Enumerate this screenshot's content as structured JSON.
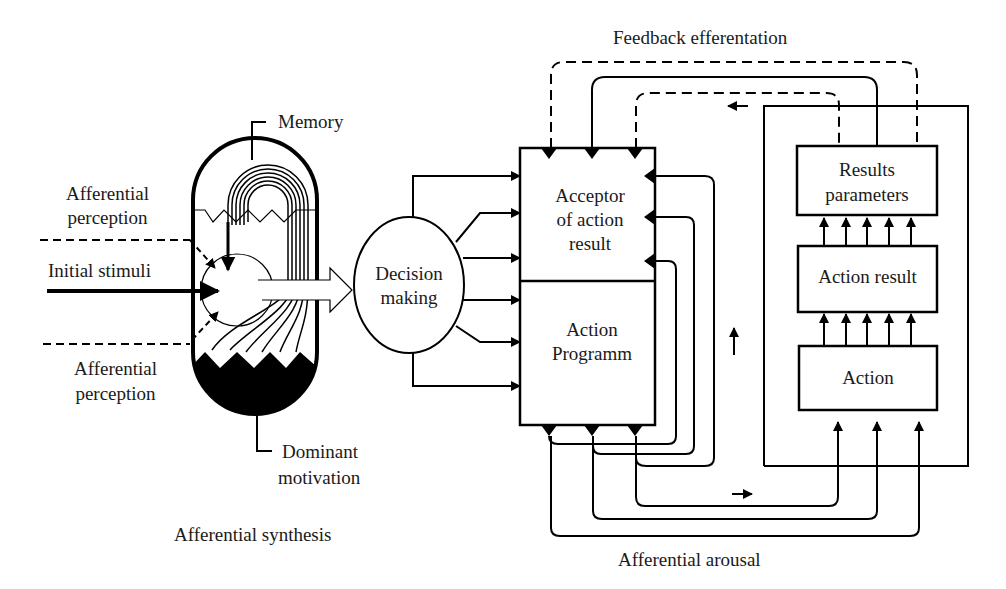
{
  "labels": {
    "feedback_efferentation": "Feedback efferentation",
    "memory": "Memory",
    "afferential_perception_top_1": "Afferential",
    "afferential_perception_top_2": "perception",
    "initial_stimuli": "Initial stimuli",
    "afferential_perception_bottom_1": "Afferential",
    "afferential_perception_bottom_2": "perception",
    "dominant_motivation_1": "Dominant",
    "dominant_motivation_2": "motivation",
    "afferential_synthesis": "Afferential synthesis",
    "decision_making_1": "Decision",
    "decision_making_2": "making",
    "acceptor_1": "Acceptor",
    "acceptor_2": "of action",
    "acceptor_3": "result",
    "action_programm_1": "Action",
    "action_programm_2": "Programm",
    "results_parameters_1": "Results",
    "results_parameters_2": "parameters",
    "action_result": "Action result",
    "action": "Action",
    "afferential_arousal": "Afferential arousal"
  },
  "colors": {
    "stroke": "#000000",
    "background": "#ffffff",
    "text": "#1a1a1a"
  }
}
